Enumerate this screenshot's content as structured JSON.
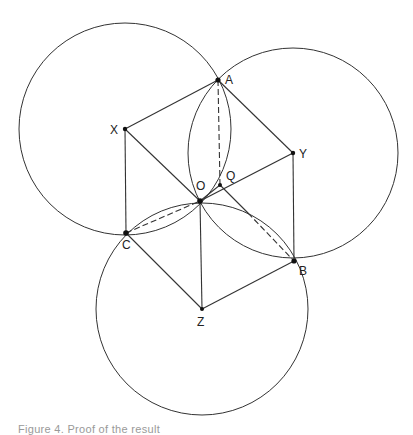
{
  "diagram": {
    "stroke_color": "#333333",
    "circles": [
      {
        "name": "circle-x",
        "center": "X",
        "r": 106
      },
      {
        "name": "circle-y",
        "center": "Y",
        "r": 105
      },
      {
        "name": "circle-z",
        "center": "Z",
        "r": 106
      }
    ],
    "points": {
      "A": {
        "label": "A",
        "x": 218,
        "y": 80
      },
      "X": {
        "label": "X",
        "x": 125,
        "y": 129
      },
      "Y": {
        "label": "Y",
        "x": 293,
        "y": 153
      },
      "O": {
        "label": "O",
        "x": 200,
        "y": 201
      },
      "Q": {
        "label": "Q",
        "x": 220,
        "y": 185
      },
      "C": {
        "label": "C",
        "x": 126,
        "y": 233
      },
      "B": {
        "label": "B",
        "x": 294,
        "y": 261
      },
      "Z": {
        "label": "Z",
        "x": 202,
        "y": 309
      }
    },
    "solid_segments": [
      [
        "X",
        "A"
      ],
      [
        "A",
        "Y"
      ],
      [
        "X",
        "O"
      ],
      [
        "X",
        "C"
      ],
      [
        "Y",
        "O"
      ],
      [
        "Y",
        "B"
      ],
      [
        "C",
        "Z"
      ],
      [
        "O",
        "Z"
      ],
      [
        "Z",
        "B"
      ],
      [
        "O",
        "Q"
      ],
      [
        "Q",
        "B"
      ]
    ],
    "dashed_segments": [
      [
        "A",
        "Q"
      ],
      [
        "C",
        "O"
      ],
      [
        "O",
        "B"
      ]
    ]
  },
  "caption": "Figure 4.   Proof of the result"
}
